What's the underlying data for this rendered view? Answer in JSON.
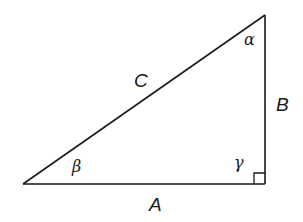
{
  "diagram": {
    "type": "right-triangle",
    "colors": {
      "stroke": "#1a1a1a",
      "background": "#ffffff"
    },
    "vertices": {
      "top": [
        265,
        15
      ],
      "bottom_left": [
        23,
        184
      ],
      "right_angle": [
        265,
        184
      ]
    },
    "sides": {
      "hypotenuse": {
        "label": "C"
      },
      "vertical": {
        "label": "B"
      },
      "base": {
        "label": "A"
      }
    },
    "angles": {
      "top": {
        "label": "α"
      },
      "bottom_left": {
        "label": "β"
      },
      "right": {
        "label": "γ",
        "marker": "right-angle-square"
      }
    }
  }
}
